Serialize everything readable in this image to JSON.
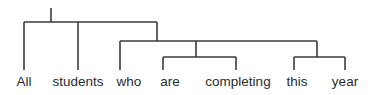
{
  "figure": {
    "kind": "syntax-tree-diagram",
    "sentence": "All students who are completing this year",
    "background_color": "#ffffff",
    "line_color": "#3b3b3b",
    "text_color": "#2b2b2b"
  },
  "leaves": [
    {
      "id": "leaf-all",
      "label": "All",
      "x": 24,
      "stem_top": 22,
      "stem_bottom": 70,
      "text_x": 24,
      "text_y": 75
    },
    {
      "id": "leaf-students",
      "label": "students",
      "x": 78,
      "stem_top": 22,
      "stem_bottom": 70,
      "text_x": 78,
      "text_y": 75
    },
    {
      "id": "leaf-who",
      "label": "who",
      "x": 120,
      "stem_top": 41,
      "stem_bottom": 70,
      "text_x": 129,
      "text_y": 75
    },
    {
      "id": "leaf-are",
      "label": "are",
      "x": 163,
      "stem_top": 57,
      "stem_bottom": 70,
      "text_x": 170,
      "text_y": 75
    },
    {
      "id": "leaf-completing",
      "label": "completing",
      "x": 236,
      "stem_top": 57,
      "stem_bottom": 70,
      "text_x": 238,
      "text_y": 75
    },
    {
      "id": "leaf-this",
      "label": "this",
      "x": 294,
      "stem_top": 57,
      "stem_bottom": 70,
      "text_x": 297,
      "text_y": 75
    },
    {
      "id": "leaf-year",
      "label": "year",
      "x": 345,
      "stem_top": 57,
      "stem_bottom": 70,
      "text_x": 345,
      "text_y": 75
    }
  ],
  "edges": {
    "root_stem": {
      "x": 51,
      "y1": 8,
      "y2": 22
    },
    "bar_top": {
      "y": 22,
      "x1": 24,
      "x2": 157
    },
    "bar_second": {
      "y": 41,
      "x1": 120,
      "x2": 317
    },
    "bar_are": {
      "y": 57,
      "x1": 163,
      "x2": 236
    },
    "bar_this": {
      "y": 57,
      "x1": 294,
      "x2": 345
    },
    "drop_top_right": {
      "x": 157,
      "y1": 22,
      "y2": 41
    },
    "drop_second_mid": {
      "x": 196,
      "y1": 41,
      "y2": 57
    },
    "drop_second_right": {
      "x": 317,
      "y1": 41,
      "y2": 57
    }
  }
}
